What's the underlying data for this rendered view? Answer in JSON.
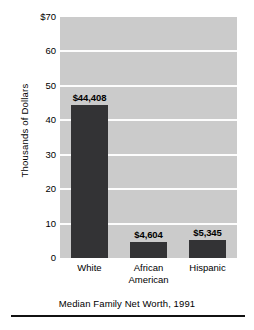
{
  "chart_data": {
    "type": "bar",
    "title": "",
    "caption": "Median Family Net Worth, 1991",
    "xlabel": "",
    "ylabel": "Thousands of Dollars",
    "categories": [
      "White",
      "African American",
      "Hispanic"
    ],
    "category_lines": [
      [
        "White"
      ],
      [
        "African",
        "American"
      ],
      [
        "Hispanic"
      ]
    ],
    "values": [
      44.408,
      4.604,
      5.345
    ],
    "value_labels": [
      "$44,408",
      "$4,604",
      "$5,345"
    ],
    "ylim": [
      0,
      70
    ],
    "yticks": [
      0,
      10,
      20,
      30,
      40,
      50,
      60,
      70
    ],
    "ytick_labels": [
      "0",
      "10",
      "20",
      "30",
      "40",
      "50",
      "60",
      "$70"
    ],
    "grid": true,
    "legend": "none",
    "colors": {
      "bar": "#333335",
      "plot_background": "#cbcbcb",
      "gridline": "#fdfdfd",
      "text": "#000000",
      "rule": "#111111"
    }
  }
}
